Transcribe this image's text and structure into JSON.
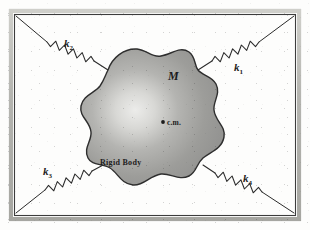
{
  "figure": {
    "frame": {
      "outer_color": "#4a4a4a",
      "band_color": "#b9b9b4",
      "inner_color": "#3c3c3c"
    },
    "body": {
      "label_mass": "M",
      "label_center_of_mass": "c.m.",
      "label_name": "Rigid Body",
      "fill_color": "#9d9d9d",
      "highlight_color": "#e8e8e6",
      "outline_color": "#2e2e2e"
    },
    "springs": [
      {
        "id": "k1",
        "label": "k",
        "subscript": "1",
        "position": "upper-right"
      },
      {
        "id": "k2",
        "label": "k",
        "subscript": "2",
        "position": "upper-left"
      },
      {
        "id": "k3",
        "label": "k",
        "subscript": "3",
        "position": "lower-left"
      },
      {
        "id": "k4",
        "label": "k",
        "subscript": "4",
        "position": "lower-right"
      }
    ],
    "background_color": "#fdfdfc",
    "line_color": "#2b2b2b"
  }
}
